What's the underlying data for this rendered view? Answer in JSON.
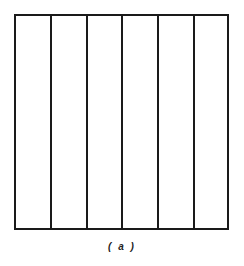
{
  "figure": {
    "caption": "( a )",
    "panel_count": 6,
    "line_color": "#1a1a1a",
    "divider_x": [
      50,
      86,
      122,
      158,
      193
    ]
  }
}
